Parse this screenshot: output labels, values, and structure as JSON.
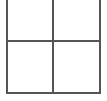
{
  "figure": {
    "name": "four-pane-grid",
    "width": 107,
    "height": 101,
    "background_color": "#ffffff",
    "line_color": "#555555",
    "line_width": 2
  },
  "geometry": {
    "vertical_lines": [
      {
        "name": "left-vertical-line",
        "x": 6,
        "y_start": 0,
        "y_end": 94
      },
      {
        "name": "middle-vertical-line",
        "x": 52,
        "y_start": 0,
        "y_end": 94
      },
      {
        "name": "right-vertical-line",
        "x": 99,
        "y_start": 0,
        "y_end": 94
      }
    ],
    "horizontal_lines": [
      {
        "name": "middle-horizontal-line",
        "y": 40,
        "x_start": 6,
        "x_end": 101
      },
      {
        "name": "bottom-horizontal-line",
        "y": 92,
        "x_start": 6,
        "x_end": 101
      }
    ]
  },
  "panes": [
    {
      "name": "pane-top-left",
      "label": "",
      "x": 8,
      "y": 0,
      "width": 44,
      "height": 40
    },
    {
      "name": "pane-top-right",
      "label": "",
      "x": 54,
      "y": 0,
      "width": 45,
      "height": 40
    },
    {
      "name": "pane-bottom-left",
      "label": "",
      "x": 8,
      "y": 42,
      "width": 44,
      "height": 50
    },
    {
      "name": "pane-bottom-right",
      "label": "",
      "x": 54,
      "y": 42,
      "width": 45,
      "height": 50
    }
  ]
}
